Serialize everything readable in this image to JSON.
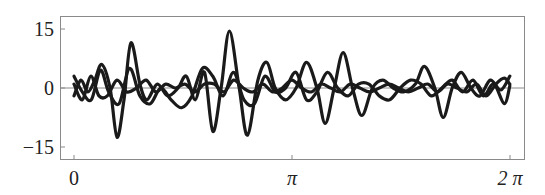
{
  "chart_data": {
    "type": "line",
    "title": "",
    "xlabel": "",
    "ylabel": "",
    "xlim": [
      -0.13,
      6.56
    ],
    "ylim": [
      -18,
      18.5
    ],
    "grid": false,
    "legend": null,
    "x_ticks": [
      {
        "value": 0,
        "label": "0"
      },
      {
        "value": 3.1416,
        "label": "π"
      },
      {
        "value": 6.2832,
        "label": "2 π"
      }
    ],
    "y_ticks": [
      {
        "value": 15,
        "label": "15"
      },
      {
        "value": 0,
        "label": "0"
      },
      {
        "value": -15,
        "label": "−15"
      }
    ],
    "zero_line": true,
    "series": [
      {
        "name": "curve-large",
        "color": "#1a1a1a",
        "x": [
          0.0,
          0.1,
          0.2,
          0.3,
          0.4,
          0.52,
          0.62,
          0.72,
          0.82,
          0.95,
          1.05,
          1.2,
          1.35,
          1.5,
          1.62,
          1.75,
          1.88,
          2.0,
          2.12,
          2.24,
          2.38,
          2.5,
          2.65,
          2.78,
          2.9,
          3.05,
          3.2,
          3.35,
          3.5,
          3.62,
          3.75,
          3.88,
          4.02,
          4.15,
          4.3,
          4.45,
          4.6,
          4.75,
          4.92,
          5.05,
          5.2,
          5.32,
          5.45,
          5.58,
          5.72,
          5.85,
          6.0,
          6.15,
          6.28
        ],
        "y": [
          -2,
          2,
          -1,
          2,
          6,
          0,
          -12.5,
          -3,
          11.5,
          1,
          -3,
          1,
          -2,
          0,
          3,
          -3,
          4,
          -11,
          0,
          14.5,
          0,
          -12,
          2,
          6.5,
          0,
          -3,
          0,
          6.5,
          0,
          -9,
          0,
          9,
          -0.5,
          -7,
          0,
          2,
          0,
          -1,
          1,
          5.5,
          0,
          -7.5,
          0,
          4,
          0,
          -2,
          2,
          -0.5,
          3
        ]
      },
      {
        "name": "curve-medium",
        "color": "#1a1a1a",
        "x": [
          0.0,
          0.12,
          0.25,
          0.38,
          0.5,
          0.65,
          0.8,
          0.95,
          1.1,
          1.25,
          1.4,
          1.55,
          1.7,
          1.85,
          2.0,
          2.15,
          2.3,
          2.45,
          2.6,
          2.75,
          2.9,
          3.05,
          3.2,
          3.35,
          3.5,
          3.65,
          3.8,
          3.95,
          4.1,
          4.25,
          4.4,
          4.55,
          4.7,
          4.85,
          5.0,
          5.15,
          5.3,
          5.45,
          5.6,
          5.75,
          5.9,
          6.05,
          6.2,
          6.28
        ],
        "y": [
          3,
          -1,
          -3,
          4.5,
          -1,
          -4,
          5,
          -2,
          -4,
          0,
          -3,
          -5,
          -2,
          5,
          3,
          -2,
          4,
          -3,
          -4,
          3,
          -1,
          0,
          4,
          -3,
          -1,
          4,
          0,
          -2,
          1,
          1,
          -2,
          -3,
          0,
          2,
          1,
          -2,
          0,
          2,
          -1,
          2,
          -2,
          1,
          -4,
          0.5
        ]
      },
      {
        "name": "curve-small",
        "color": "#1a1a1a",
        "x": [
          0.0,
          0.12,
          0.24,
          0.36,
          0.48,
          0.62,
          0.76,
          0.9,
          1.04,
          1.18,
          1.32,
          1.46,
          1.6,
          1.74,
          1.88,
          2.02,
          2.16,
          2.3,
          2.44,
          2.58,
          2.72,
          2.86,
          3.0,
          3.14,
          3.28,
          3.42,
          3.56,
          3.7,
          3.84,
          3.98,
          4.12,
          4.26,
          4.4,
          4.54,
          4.68,
          4.82,
          4.96,
          5.1,
          5.24,
          5.38,
          5.52,
          5.66,
          5.8,
          5.94,
          6.08,
          6.2,
          6.28
        ],
        "y": [
          1,
          -3,
          3,
          -2,
          -2,
          2,
          -1,
          0,
          2,
          -1,
          1,
          0,
          1,
          -1,
          1,
          1,
          -1,
          2,
          0,
          -1,
          1,
          -1,
          0,
          2,
          0,
          -1,
          1,
          0,
          -1,
          1,
          0,
          -1,
          0,
          1,
          0,
          -1,
          0,
          1,
          -1,
          1,
          0,
          -1,
          1,
          -2,
          1,
          2.5,
          1
        ]
      }
    ]
  }
}
